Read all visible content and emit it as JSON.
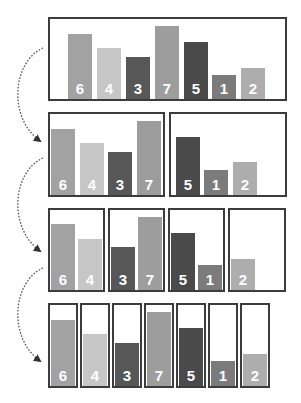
{
  "colors": {
    "border": "#3c3c3c",
    "arrow": "#555555",
    "label": "#ffffff",
    "value_6": "#a2a2a2",
    "value_4": "#c6c6c6",
    "value_3": "#575757",
    "value_7": "#9d9d9d",
    "value_5": "#4a4a4a",
    "value_1": "#7b7b7b",
    "value_2": "#adadad"
  },
  "levels": [
    {
      "groups": [
        {
          "values": [
            "6",
            "4",
            "3",
            "7",
            "5",
            "1",
            "2"
          ]
        }
      ]
    },
    {
      "groups": [
        {
          "values": [
            "6",
            "4",
            "3",
            "7"
          ]
        },
        {
          "values": [
            "5",
            "1",
            "2"
          ]
        }
      ]
    },
    {
      "groups": [
        {
          "values": [
            "6",
            "4"
          ]
        },
        {
          "values": [
            "3",
            "7"
          ]
        },
        {
          "values": [
            "5",
            "1"
          ]
        },
        {
          "values": [
            "2"
          ]
        }
      ]
    },
    {
      "groups": [
        {
          "values": [
            "6"
          ]
        },
        {
          "values": [
            "4"
          ]
        },
        {
          "values": [
            "3"
          ]
        },
        {
          "values": [
            "7"
          ]
        },
        {
          "values": [
            "5"
          ]
        },
        {
          "values": [
            "1"
          ]
        },
        {
          "values": [
            "2"
          ]
        }
      ]
    }
  ],
  "arrows": [
    {
      "from_level": 0,
      "to_level": 1,
      "style": "dotted-curve"
    },
    {
      "from_level": 1,
      "to_level": 2,
      "style": "dotted-curve"
    },
    {
      "from_level": 2,
      "to_level": 3,
      "style": "dotted-curve"
    }
  ]
}
